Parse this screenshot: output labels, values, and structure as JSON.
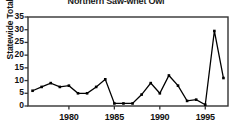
{
  "chart_data": {
    "type": "line",
    "title": "Northern Saw-whet Owl",
    "xlabel": "",
    "ylabel": "Statewide Totals",
    "xlim": [
      1975.5,
      1997.5
    ],
    "ylim": [
      0,
      35
    ],
    "grid": false,
    "legend": null,
    "xticks": [
      1980,
      1985,
      1990,
      1995
    ],
    "xtick_labels": [
      "1980",
      "1985",
      "1990",
      "1995"
    ],
    "yticks": [
      0,
      5,
      10,
      15,
      20,
      25,
      30,
      35
    ],
    "ytick_labels": [
      "0",
      "5",
      "10",
      "15",
      "20",
      "25",
      "30",
      "35"
    ],
    "marker": "square",
    "line_color": "#000000",
    "series": [
      {
        "name": "Statewide Totals",
        "x": [
          1976,
          1977,
          1978,
          1979,
          1980,
          1981,
          1982,
          1983,
          1984,
          1985,
          1986,
          1987,
          1988,
          1989,
          1990,
          1991,
          1992,
          1993,
          1994,
          1995,
          1996,
          1997
        ],
        "values": [
          6,
          7.5,
          9,
          7.5,
          8,
          5,
          5,
          7.5,
          10.5,
          1,
          1,
          1,
          4.5,
          9,
          5,
          12,
          8,
          2,
          2.5,
          0.5,
          29.5,
          11
        ]
      }
    ]
  },
  "figure": {
    "background_color": "#ffffff",
    "axis_color": "#333333",
    "text_color": "#111111"
  }
}
